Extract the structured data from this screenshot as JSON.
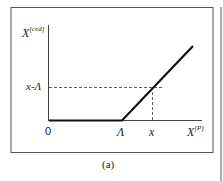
{
  "diagram": {
    "y_axis_label": {
      "base": "X",
      "sup": "[ced]"
    },
    "x_axis_label": {
      "base": "X",
      "sup": "[P]"
    },
    "y_tick": "x-Λ",
    "x_ticks": {
      "origin": "0",
      "kink": "Λ",
      "x": "x"
    },
    "caption": "(a)",
    "curve": "max(x - Λ, 0)",
    "colors": {
      "line": "#111111",
      "frame": "#555555"
    }
  }
}
